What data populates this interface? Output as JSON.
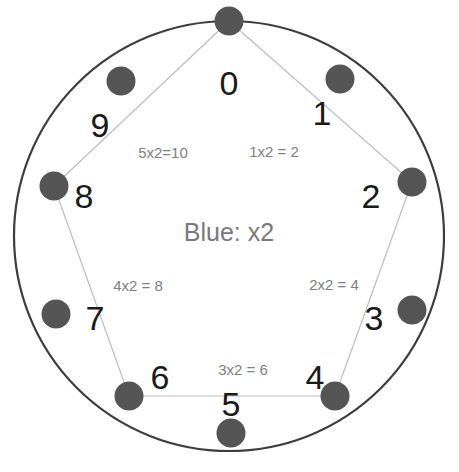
{
  "figure": {
    "center_caption": "Blue: x2",
    "circle": {
      "cx": 229,
      "cy": 236,
      "r": 215,
      "stroke_color": "#3d3d3d",
      "stroke_width": 2.2,
      "fill_color": "#ffffff"
    },
    "node_style": {
      "fill_color": "#555555",
      "radius": 14.5
    },
    "chord_style": {
      "stroke_color": "#bdbdbd",
      "stroke_width": 1.2
    }
  },
  "nodes": [
    {
      "label": "0",
      "value": 0,
      "angle_deg": 0,
      "dot_x": 229,
      "dot_y": 21,
      "label_x": 229,
      "label_y": 83
    },
    {
      "label": "1",
      "value": 1,
      "angle_deg": 36,
      "dot_x": 340,
      "dot_y": 79,
      "label_x": 322,
      "label_y": 113
    },
    {
      "label": "2",
      "value": 2,
      "angle_deg": 72,
      "dot_x": 412,
      "dot_y": 182,
      "label_x": 371,
      "label_y": 196
    },
    {
      "label": "3",
      "value": 3,
      "angle_deg": 108,
      "dot_x": 412,
      "dot_y": 310,
      "label_x": 374,
      "label_y": 318
    },
    {
      "label": "4",
      "value": 4,
      "angle_deg": 144,
      "dot_x": 335,
      "dot_y": 396,
      "label_x": 315,
      "label_y": 377
    },
    {
      "label": "5",
      "value": 5,
      "angle_deg": 180,
      "dot_x": 231,
      "dot_y": 433,
      "label_x": 231,
      "label_y": 404
    },
    {
      "label": "6",
      "value": 6,
      "angle_deg": 216,
      "dot_x": 129,
      "dot_y": 396,
      "label_x": 160,
      "label_y": 377
    },
    {
      "label": "7",
      "value": 7,
      "angle_deg": 252,
      "dot_x": 56,
      "dot_y": 314,
      "label_x": 95,
      "label_y": 318
    },
    {
      "label": "8",
      "value": 8,
      "angle_deg": 288,
      "dot_x": 54,
      "dot_y": 186,
      "label_x": 84,
      "label_y": 196
    },
    {
      "label": "9",
      "value": 9,
      "angle_deg": 324,
      "dot_x": 121,
      "dot_y": 81,
      "label_x": 100,
      "label_y": 125
    }
  ],
  "chords": [
    {
      "from": 0,
      "to": 2,
      "label": "1x2 = 2",
      "label_x": 274,
      "label_y": 151
    },
    {
      "from": 2,
      "to": 4,
      "label": "2x2 = 4",
      "label_x": 334,
      "label_y": 284
    },
    {
      "from": 4,
      "to": 6,
      "label": "3x2 = 6",
      "label_x": 243,
      "label_y": 369
    },
    {
      "from": 6,
      "to": 8,
      "label": "4x2 = 8",
      "label_x": 138,
      "label_y": 285
    },
    {
      "from": 8,
      "to": 0,
      "label": "5x2=10",
      "label_x": 163,
      "label_y": 152
    }
  ]
}
